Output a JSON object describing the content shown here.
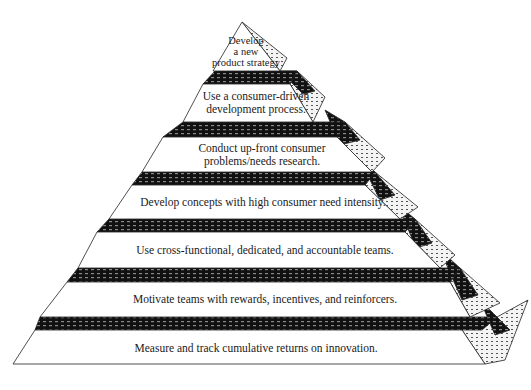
{
  "diagram": {
    "type": "pyramid",
    "colors": {
      "front": "#ffffff",
      "band": "#111111",
      "band_dots": "#9a9a9a",
      "side": "#f2f2f2",
      "side_dots": "#555555",
      "stroke": "#222222"
    },
    "tiers": [
      {
        "label": "Develop\na new\nproduct strategy",
        "label_x": 246,
        "label_y": 35,
        "front": "242,22 213,71 280,71",
        "band": "",
        "wrap": "",
        "side": "242,22 287,58 280,71"
      },
      {
        "label": "Use a consumer-driven\ndevelopment process.",
        "label_x": 256,
        "label_y": 90,
        "band": "215,71 297,71 290,84 203,84",
        "wrap": "280,71 297,71 315,91 303,94",
        "front": "203,84 290,84 313,122 183,122",
        "side": "297,71 325,97 313,122 290,84"
      },
      {
        "label": "Conduct up-front consumer\nproblems/needs research.",
        "label_x": 262,
        "label_y": 142,
        "band": "183,122 345,122 337,137 163,137",
        "wrap": "325,110 345,122 360,140 340,145",
        "front": "163,137 337,137 372,172 142,172",
        "side": "345,122 385,158 372,172 337,137"
      },
      {
        "label": "Develop concepts with high consumer need intensity.",
        "label_x": 263,
        "label_y": 196,
        "band": "142,172 375,172 365,185 132,185",
        "wrap": "360,160 375,172 395,195 380,200",
        "front": "132,185 365,185 400,219 109,219",
        "side": "375,172 418,207 400,219 365,185"
      },
      {
        "label": "Use cross-functional, dedicated, and accountable teams.",
        "label_x": 265,
        "label_y": 244,
        "band": "109,219 415,219 405,232 97,232",
        "wrap": "398,205 415,219 432,243 416,248",
        "front": "97,232 405,232 440,268 78,268",
        "side": "415,219 455,255 440,268 405,232"
      },
      {
        "label": "Motivate teams with rewards, incentives, and reinforcers.",
        "label_x": 265,
        "label_y": 293,
        "band": "78,268 460,268 450,282 67,282",
        "wrap": "440,250 460,268 478,295 462,300",
        "front": "67,282 450,282 470,317 40,317",
        "side": "460,268 500,303 470,317 450,282"
      },
      {
        "label": "Measure and track cumulative returns on innovation.",
        "label_x": 256,
        "label_y": 342,
        "band": "40,317 497,317 482,330 35,330",
        "wrap": "480,300 497,317 510,330 495,335",
        "front": "35,330 462,330 485,364 13,364",
        "side": "497,317 528,300 505,360 485,364 462,330"
      }
    ]
  }
}
